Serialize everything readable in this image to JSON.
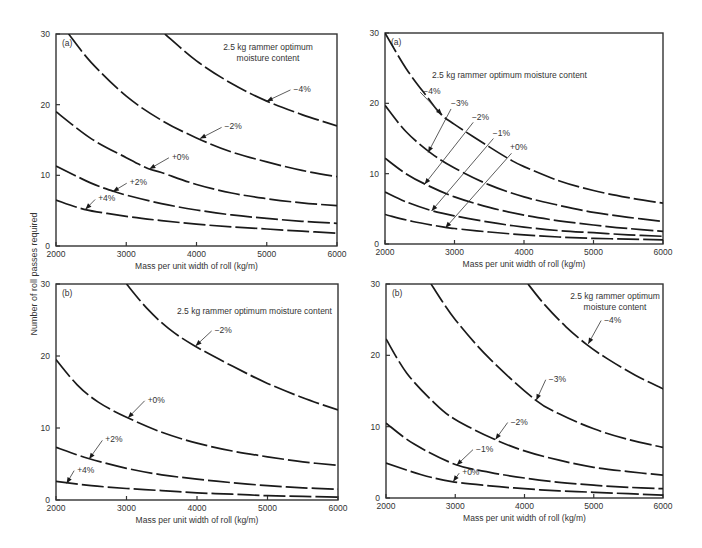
{
  "figure": {
    "shared_ylabel": "Number of roll passes required"
  },
  "chart_data": [
    {
      "id": "top-left",
      "type": "line",
      "panel_label": "(a)",
      "title": "2.5 kg rammer optimum moisture content",
      "title_lines": [
        "2.5 kg rammer optimum",
        "moisture content"
      ],
      "xlabel": "Mass per unit width of roll (kg/m)",
      "ylabel": "Number of roll passes required",
      "xlim": [
        2000,
        6000
      ],
      "ylim": [
        0,
        30
      ],
      "xticks": [
        2000,
        3000,
        4000,
        5000,
        6000
      ],
      "yticks": [
        0,
        10,
        20,
        30
      ],
      "grid": false,
      "series": [
        {
          "name": "-4%",
          "x": [
            3550,
            4000,
            4500,
            5000,
            5500,
            6000
          ],
          "values": [
            30,
            26.2,
            23.0,
            20.5,
            18.6,
            17.0
          ]
        },
        {
          "name": "-2%",
          "x": [
            2180,
            2500,
            3000,
            3500,
            4000,
            4500,
            5000,
            5500,
            6000
          ],
          "values": [
            30,
            26.0,
            21.2,
            17.8,
            15.3,
            13.3,
            11.9,
            10.7,
            9.8
          ]
        },
        {
          "name": "+0%",
          "x": [
            2000,
            2500,
            3000,
            3300,
            3500,
            4000,
            4500,
            5000,
            5500,
            6000
          ],
          "values": [
            19.0,
            15.2,
            12.5,
            11.0,
            10.4,
            8.7,
            7.5,
            6.7,
            6.1,
            5.7
          ]
        },
        {
          "name": "+2%",
          "x": [
            2000,
            2500,
            2800,
            3000,
            3500,
            4000,
            4500,
            5000,
            5500,
            6000
          ],
          "values": [
            11.3,
            8.9,
            7.8,
            7.2,
            6.0,
            5.1,
            4.4,
            3.9,
            3.5,
            3.2
          ]
        },
        {
          "name": "+4%",
          "x": [
            2000,
            2400,
            3000,
            3500,
            4000,
            4500,
            5000,
            5500,
            6000
          ],
          "values": [
            6.5,
            5.2,
            4.2,
            3.6,
            3.1,
            2.7,
            2.4,
            2.1,
            1.8
          ]
        }
      ],
      "annotations": [
        {
          "text": "-4%",
          "text_at": [
            5380,
            21.8
          ],
          "arrow_to": [
            5000,
            20.5
          ]
        },
        {
          "text": "-2%",
          "text_at": [
            4400,
            16.5
          ],
          "arrow_to": [
            4050,
            15.2
          ]
        },
        {
          "text": "+0%",
          "text_at": [
            3650,
            12.2
          ],
          "arrow_to": [
            3330,
            10.9
          ]
        },
        {
          "text": "+2%",
          "text_at": [
            3050,
            8.6
          ],
          "arrow_to": [
            2810,
            7.7
          ]
        },
        {
          "text": "+4%",
          "text_at": [
            2600,
            6.3
          ],
          "arrow_to": [
            2420,
            5.2
          ]
        }
      ]
    },
    {
      "id": "top-right",
      "type": "line",
      "panel_label": "(a)",
      "title": "2.5 kg rammer optimum moisture content",
      "title_lines": [
        "2.5 kg rammer optimum moisture content"
      ],
      "xlabel": "Mass per unit width of roll (kg/m)",
      "ylabel": "Number of roll passes required",
      "xlim": [
        2000,
        6000
      ],
      "ylim": [
        0,
        30
      ],
      "xticks": [
        2000,
        3000,
        4000,
        5000,
        6000
      ],
      "yticks": [
        0,
        10,
        20,
        30
      ],
      "grid": false,
      "series": [
        {
          "name": "-4%",
          "x": [
            2000,
            2300,
            2600,
            2800,
            3000,
            3500,
            3800,
            4000,
            4500,
            5000,
            5500,
            6000
          ],
          "values": [
            30,
            25.0,
            21.0,
            18.5,
            17.0,
            13.8,
            12.0,
            11.0,
            9.0,
            7.6,
            6.6,
            5.8
          ]
        },
        {
          "name": "-3%",
          "x": [
            2000,
            2300,
            2650,
            3000,
            3500,
            4000,
            4500,
            5000,
            5500,
            6000
          ],
          "values": [
            19.7,
            16.0,
            13.0,
            10.8,
            8.4,
            6.7,
            5.5,
            4.5,
            3.8,
            3.2
          ]
        },
        {
          "name": "-2%",
          "x": [
            2000,
            2300,
            2600,
            3000,
            3500,
            4000,
            4500,
            5000,
            5500,
            6000
          ],
          "values": [
            12.2,
            10.0,
            8.4,
            6.7,
            5.2,
            4.1,
            3.3,
            2.7,
            2.2,
            1.8
          ]
        },
        {
          "name": "-1%",
          "x": [
            2000,
            2300,
            2650,
            3000,
            3500,
            4000,
            4500,
            5000,
            5500,
            6000
          ],
          "values": [
            7.4,
            6.0,
            4.8,
            4.0,
            3.1,
            2.4,
            1.9,
            1.6,
            1.3,
            1.1
          ]
        },
        {
          "name": "+0%",
          "x": [
            2000,
            2400,
            2850,
            3000,
            3500,
            4000,
            4500,
            5000,
            5500,
            6000
          ],
          "values": [
            4.2,
            3.2,
            2.4,
            2.2,
            1.7,
            1.3,
            1.0,
            0.8,
            0.7,
            0.6
          ]
        }
      ],
      "annotations": [
        {
          "text": "-4%",
          "text_at": [
            2550,
            21.3
          ],
          "arrow_to": [
            2820,
            18.4
          ]
        },
        {
          "text": "-3%",
          "text_at": [
            2950,
            19.6
          ],
          "arrow_to": [
            2620,
            13.0
          ]
        },
        {
          "text": "-2%",
          "text_at": [
            3250,
            17.6
          ],
          "arrow_to": [
            2570,
            8.5
          ]
        },
        {
          "text": "-1%",
          "text_at": [
            3550,
            15.4
          ],
          "arrow_to": [
            2670,
            4.7
          ]
        },
        {
          "text": "+0%",
          "text_at": [
            3800,
            13.4
          ],
          "arrow_to": [
            2870,
            2.3
          ]
        }
      ],
      "arrow_leaders": [
        {
          "from": [
            2950,
            19.2
          ],
          "to": [
            2620,
            13.0
          ]
        },
        {
          "from": [
            3270,
            17.3
          ],
          "to": [
            2570,
            8.5
          ]
        },
        {
          "from": [
            3560,
            15.0
          ],
          "to": [
            2670,
            4.7
          ]
        },
        {
          "from": [
            3820,
            12.9
          ],
          "to": [
            2870,
            2.3
          ]
        }
      ]
    },
    {
      "id": "bottom-left",
      "type": "line",
      "panel_label": "(b)",
      "title": "2.5 kg rammer optimum moisture content",
      "title_lines": [
        "2.5 kg rammer optimum moisture content"
      ],
      "xlabel": "Mass per unit width of roll (kg/m)",
      "ylabel": "Number of roll passes required",
      "xlim": [
        2000,
        6000
      ],
      "ylim": [
        0,
        30
      ],
      "xticks": [
        2000,
        3000,
        4000,
        5000,
        6000
      ],
      "yticks": [
        0,
        10,
        20,
        30
      ],
      "grid": false,
      "series": [
        {
          "name": "-2%",
          "x": [
            3000,
            3300,
            3600,
            3950,
            4500,
            5000,
            5500,
            6000
          ],
          "values": [
            30,
            26.5,
            23.8,
            21.5,
            18.6,
            16.2,
            14.2,
            12.5
          ]
        },
        {
          "name": "+0%",
          "x": [
            2000,
            2300,
            2600,
            3000,
            3500,
            4000,
            4500,
            5000,
            5500,
            6000
          ],
          "values": [
            19.5,
            16.0,
            13.6,
            11.5,
            9.4,
            7.9,
            6.8,
            6.0,
            5.3,
            4.8
          ]
        },
        {
          "name": "+2%",
          "x": [
            2000,
            2450,
            3000,
            3500,
            4000,
            4500,
            5000,
            5500,
            6000
          ],
          "values": [
            7.3,
            5.8,
            4.4,
            3.5,
            2.9,
            2.4,
            2.0,
            1.7,
            1.5
          ]
        },
        {
          "name": "+4%",
          "x": [
            2000,
            2500,
            3000,
            3500,
            4000,
            4500,
            5000,
            5500,
            6000
          ],
          "values": [
            2.6,
            2.0,
            1.6,
            1.3,
            1.0,
            0.8,
            0.6,
            0.5,
            0.4
          ]
        }
      ],
      "annotations": [
        {
          "text": "-2%",
          "text_at": [
            4250,
            23.2
          ],
          "arrow_to": [
            3980,
            21.4
          ]
        },
        {
          "text": "+0%",
          "text_at": [
            3300,
            13.5
          ],
          "arrow_to": [
            3020,
            11.4
          ]
        },
        {
          "text": "+2%",
          "text_at": [
            2700,
            8.0
          ],
          "arrow_to": [
            2470,
            5.7
          ]
        },
        {
          "text": "+4%",
          "text_at": [
            2300,
            3.8
          ],
          "arrow_to": [
            2150,
            2.3
          ]
        }
      ]
    },
    {
      "id": "bottom-right",
      "type": "line",
      "panel_label": "(b)",
      "title": "2.5 kg rammer optimum moisture content",
      "title_lines": [
        "2.5 kg rammer optimum",
        "moisture content"
      ],
      "xlabel": "Mass per unit width of roll (kg/m)",
      "ylabel": "Number of roll passes required",
      "xlim": [
        2000,
        6000
      ],
      "ylim": [
        0,
        30
      ],
      "xticks": [
        2000,
        3000,
        4000,
        5000,
        6000
      ],
      "yticks": [
        0,
        10,
        20,
        30
      ],
      "grid": false,
      "series": [
        {
          "name": "-4%",
          "x": [
            4050,
            4300,
            4600,
            4900,
            5200,
            5600,
            6000
          ],
          "values": [
            30,
            27.0,
            24.0,
            21.5,
            19.5,
            17.2,
            15.3
          ]
        },
        {
          "name": "-3%",
          "x": [
            2650,
            3000,
            3500,
            4150,
            4500,
            5000,
            5500,
            6000
          ],
          "values": [
            30,
            25.0,
            19.5,
            13.8,
            11.8,
            9.7,
            8.2,
            7.1
          ]
        },
        {
          "name": "-2%",
          "x": [
            2000,
            2300,
            2700,
            3000,
            3550,
            4000,
            4500,
            5000,
            5500,
            6000
          ],
          "values": [
            22.3,
            17.5,
            13.3,
            11.0,
            8.3,
            6.6,
            5.3,
            4.3,
            3.7,
            3.2
          ]
        },
        {
          "name": "-1%",
          "x": [
            2000,
            2400,
            3000,
            3500,
            4000,
            4500,
            5000,
            5500,
            6000
          ],
          "values": [
            10.5,
            7.6,
            4.7,
            3.6,
            2.8,
            2.2,
            1.8,
            1.5,
            1.3
          ]
        },
        {
          "name": "+0%",
          "x": [
            2000,
            2500,
            2950,
            3500,
            4000,
            4500,
            5000,
            5500,
            6000
          ],
          "values": [
            4.9,
            3.3,
            2.3,
            1.7,
            1.3,
            1.0,
            0.8,
            0.6,
            0.4
          ]
        }
      ],
      "annotations": [
        {
          "text": "-4%",
          "text_at": [
            5150,
            24.6
          ],
          "arrow_to": [
            4920,
            21.6
          ]
        },
        {
          "text": "-3%",
          "text_at": [
            4350,
            16.3
          ],
          "arrow_to": [
            4170,
            13.7
          ]
        },
        {
          "text": "-2%",
          "text_at": [
            3800,
            10.3
          ],
          "arrow_to": [
            3580,
            8.2
          ]
        },
        {
          "text": "-1%",
          "text_at": [
            3300,
            6.5
          ],
          "arrow_to": [
            3020,
            4.6
          ]
        },
        {
          "text": "+0%",
          "text_at": [
            3100,
            3.2
          ],
          "arrow_to": [
            2970,
            2.3
          ]
        }
      ]
    }
  ]
}
